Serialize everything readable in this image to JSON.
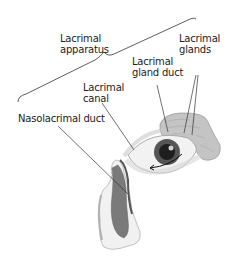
{
  "diagram": {
    "labels": {
      "lacrimal_apparatus": "Lacrimal\napparatus",
      "lacrimal_glands": "Lacrimal\nglands",
      "lacrimal_gland_duct": "Lacrimal\ngland duct",
      "lacrimal_canal": "Lacrimal\ncanal",
      "nasolacrimal_duct": "Nasolacrimal duct"
    },
    "colors": {
      "text": "#222222",
      "leader_line": "#333333",
      "gland_fill": "#b8b8b8",
      "iris": "#2a2a2a",
      "nose_duct": "#6f6f6f"
    }
  }
}
